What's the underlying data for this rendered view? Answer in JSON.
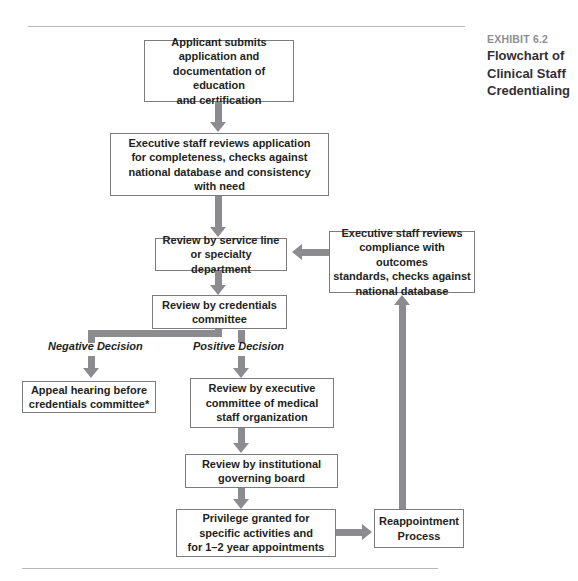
{
  "exhibit": {
    "label": "EXHIBIT 6.2",
    "title_lines": [
      "Flowchart of",
      "Clinical Staff",
      "Credentialing"
    ]
  },
  "colors": {
    "box_border": "#7c7c80",
    "connector": "#8c8c90",
    "rule": "#b9b9bd",
    "text": "#231f20",
    "caption_label": "#8e8e93",
    "background": "#ffffff"
  },
  "flowchart": {
    "nodes": [
      {
        "id": "applicant-submits",
        "text": "Applicant submits\napplication and\ndocumentation of education\nand certification"
      },
      {
        "id": "executive-staff-reviews-application",
        "text": "Executive staff reviews application\nfor completeness, checks against\nnational database and consistency\nwith need"
      },
      {
        "id": "review-by-service-line",
        "text": "Review by service line\nor specialty department"
      },
      {
        "id": "executive-staff-reviews-compliance",
        "text": "Executive staff reviews\ncompliance with outcomes\nstandards, checks against\nnational database"
      },
      {
        "id": "review-by-credentials-committee",
        "text": "Review by credentials\ncommittee"
      },
      {
        "id": "appeal-hearing",
        "text": "Appeal hearing before\ncredentials committee*"
      },
      {
        "id": "review-by-executive-committee",
        "text": "Review by executive\ncommittee of medical\nstaff organization"
      },
      {
        "id": "review-by-governing-board",
        "text": "Review by institutional\ngoverning board"
      },
      {
        "id": "privilege-granted",
        "text": "Privilege granted for\nspecific activities and\nfor 1–2 year appointments"
      },
      {
        "id": "reappointment-process",
        "text": "Reappointment\nProcess"
      }
    ],
    "branch_labels": [
      {
        "id": "negative-decision",
        "text": "Negative Decision"
      },
      {
        "id": "positive-decision",
        "text": "Positive Decision"
      }
    ]
  }
}
